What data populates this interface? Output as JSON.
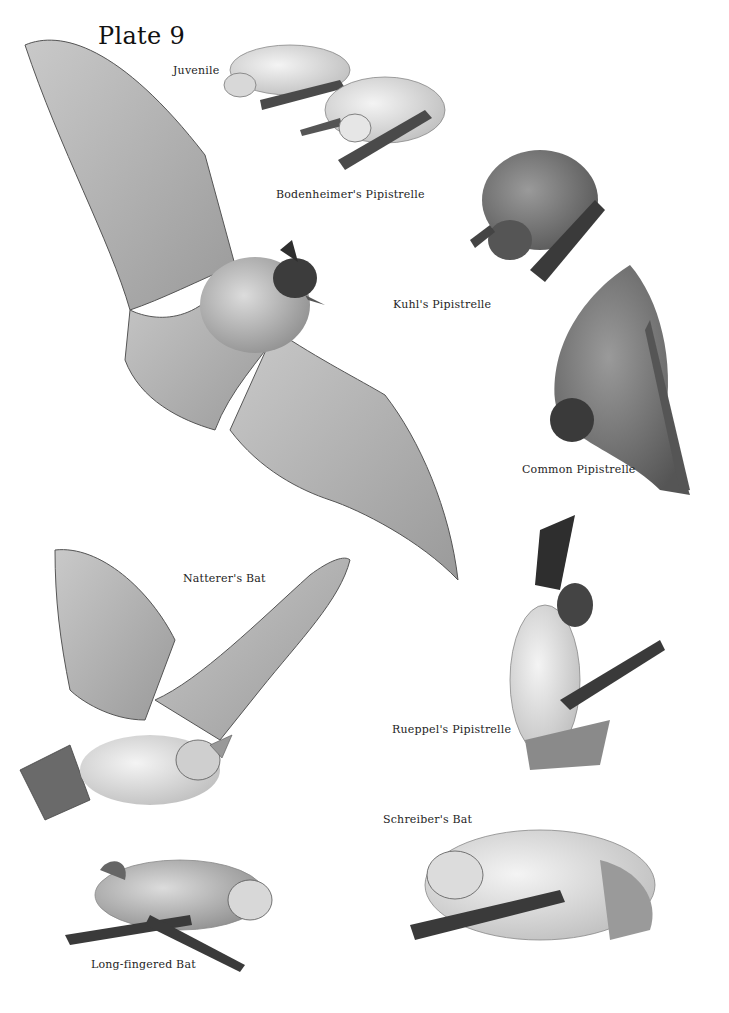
{
  "plate": {
    "title": "Plate 9"
  },
  "labels": {
    "juvenile": "Juvenile",
    "bodenheimer": "Bodenheimer's Pipistrelle",
    "kuhl": "Kuhl's Pipistrelle",
    "common": "Common Pipistrelle",
    "natterer": "Natterer's Bat",
    "rueppel": "Rueppel's Pipistrelle",
    "schreiber": "Schreiber's Bat",
    "long_fingered": "Long-fingered Bat"
  },
  "illustrations": [
    {
      "species": "Bodenheimer's Pipistrelle (juvenile)",
      "pose": "crawling"
    },
    {
      "species": "Bodenheimer's Pipistrelle",
      "pose": "crawling"
    },
    {
      "species": "Kuhl's Pipistrelle",
      "pose": "perched"
    },
    {
      "species": "Common Pipistrelle",
      "pose": "hanging"
    },
    {
      "species": "Pipistrelle",
      "pose": "flying, wings spread"
    },
    {
      "species": "Natterer's Bat",
      "pose": "flying"
    },
    {
      "species": "Rueppel's Pipistrelle",
      "pose": "hanging"
    },
    {
      "species": "Schreiber's Bat",
      "pose": "resting"
    },
    {
      "species": "Long-fingered Bat",
      "pose": "resting"
    }
  ],
  "colors": {
    "background": "#ffffff",
    "ink": "#1a1a1a",
    "wing": "#b8b8b8",
    "fur": "#8a8a8a",
    "dark": "#3a3a3a"
  }
}
